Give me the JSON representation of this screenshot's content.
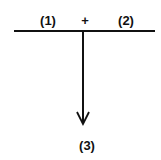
{
  "diagram": {
    "labels": {
      "left_input": "(1)",
      "operator": "+",
      "right_input": "(2)",
      "output": "(3)"
    },
    "colors": {
      "stroke": "#111111",
      "background": "#ffffff"
    }
  }
}
